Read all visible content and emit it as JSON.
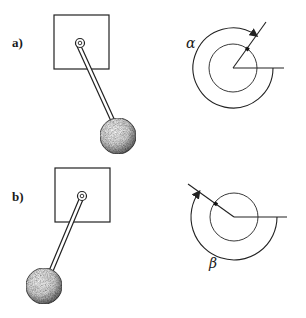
{
  "figure": {
    "panels": [
      {
        "id": "a",
        "label": "a)",
        "angle_symbol": "α",
        "pendulum_direction": "down-right",
        "angle_measured": "counterclockwise from horizontal to rod"
      },
      {
        "id": "b",
        "label": "b)",
        "angle_symbol": "β",
        "pendulum_direction": "down-left",
        "angle_measured": "clockwise from horizontal to rod"
      }
    ]
  }
}
